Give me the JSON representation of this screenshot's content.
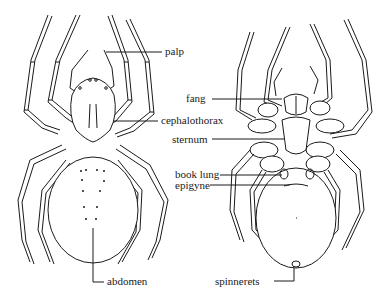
{
  "figure": {
    "left_view": "dorsal view of spider",
    "right_view": "ventral view of spider"
  },
  "labels": {
    "palp": "palp",
    "cephalothorax": "cephalothorax",
    "abdomen": "abdomen",
    "fang": "fang",
    "sternum": "sternum",
    "book_lung": "book lung",
    "epigyne": "epigyne",
    "spinnerets": "spinnerets"
  },
  "colors": {
    "line": "#1a1a1a",
    "background": "#ffffff"
  }
}
